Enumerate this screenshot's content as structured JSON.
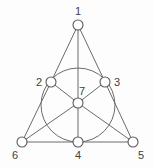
{
  "figure": {
    "name": "fano-plane-diagram",
    "background_color": "#fdfdfd",
    "stroke_color": "#6b6b6b",
    "node_fill_color": "#ffffff",
    "label_color": "#404040",
    "width": 154,
    "height": 168
  },
  "chart_data": {
    "type": "diagram",
    "title": "",
    "xlabel": "",
    "ylabel": "",
    "nodes": [
      {
        "id": "1",
        "label": "1",
        "cx": 78,
        "cy": 25,
        "r": 5,
        "label_x": 75,
        "label_y": 6
      },
      {
        "id": "2",
        "label": "2",
        "cx": 51,
        "cy": 82,
        "r": 5,
        "label_x": 36,
        "label_y": 77
      },
      {
        "id": "3",
        "label": "3",
        "cx": 105,
        "cy": 82,
        "r": 5,
        "label_x": 114,
        "label_y": 77
      },
      {
        "id": "4",
        "label": "4",
        "cx": 78,
        "cy": 142,
        "r": 5,
        "label_x": 75,
        "label_y": 150
      },
      {
        "id": "5",
        "label": "5",
        "cx": 133,
        "cy": 142,
        "r": 5,
        "label_x": 138,
        "label_y": 150
      },
      {
        "id": "6",
        "label": "6",
        "cx": 22,
        "cy": 142,
        "r": 5,
        "label_x": 12,
        "label_y": 150
      },
      {
        "id": "7",
        "label": "7",
        "cx": 78,
        "cy": 103,
        "r": 5,
        "label_x": 79,
        "label_y": 86
      }
    ],
    "edges": [
      {
        "from": "1",
        "to": "2",
        "name": "edge-1-2"
      },
      {
        "from": "2",
        "to": "6",
        "name": "edge-2-6"
      },
      {
        "from": "1",
        "to": "3",
        "name": "edge-1-3"
      },
      {
        "from": "3",
        "to": "5",
        "name": "edge-3-5"
      },
      {
        "from": "6",
        "to": "4",
        "name": "edge-6-4"
      },
      {
        "from": "4",
        "to": "5",
        "name": "edge-4-5"
      },
      {
        "from": "1",
        "to": "7",
        "name": "edge-1-7"
      },
      {
        "from": "7",
        "to": "4",
        "name": "edge-7-4"
      },
      {
        "from": "2",
        "to": "7",
        "name": "edge-2-7"
      },
      {
        "from": "7",
        "to": "5",
        "name": "edge-7-5"
      },
      {
        "from": "3",
        "to": "7",
        "name": "edge-3-7"
      },
      {
        "from": "7",
        "to": "6",
        "name": "edge-7-6"
      }
    ],
    "lines": [
      [
        "1",
        "2",
        "6"
      ],
      [
        "1",
        "3",
        "5"
      ],
      [
        "1",
        "7",
        "4"
      ],
      [
        "2",
        "7",
        "5"
      ],
      [
        "3",
        "7",
        "6"
      ],
      [
        "6",
        "4",
        "5"
      ],
      [
        "2",
        "4",
        "3"
      ]
    ],
    "incircle": {
      "cx": 78,
      "cy": 105,
      "r": 37,
      "name": "inscribed-circle"
    }
  }
}
